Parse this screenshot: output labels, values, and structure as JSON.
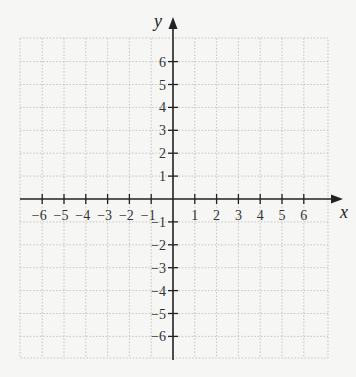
{
  "chart_data": {
    "type": "scatter",
    "title": "",
    "xlabel": "x",
    "ylabel": "y",
    "xlim": [
      -7,
      7
    ],
    "ylim": [
      -7,
      7
    ],
    "grid": true,
    "grid_style": "dotted",
    "x_ticks": [
      -6,
      -5,
      -4,
      -3,
      -2,
      -1,
      1,
      2,
      3,
      4,
      5,
      6
    ],
    "y_ticks": [
      6,
      5,
      4,
      3,
      2,
      1,
      -1,
      -2,
      -3,
      -4,
      -5,
      -6
    ],
    "x_tick_labels": [
      "−6",
      "−5",
      "−4",
      "−3",
      "−2",
      "−1",
      "1",
      "2",
      "3",
      "4",
      "5",
      "6"
    ],
    "y_tick_labels": [
      "6",
      "5",
      "4",
      "3",
      "2",
      "1",
      "−1",
      "−2",
      "−3",
      "−4",
      "−5",
      "−6"
    ],
    "series": [],
    "colors": {
      "background": "#f6f6f4",
      "grid": "#b8b8b8",
      "axis": "#222222",
      "text": "#333333"
    }
  },
  "labels": {
    "x_axis": "x",
    "y_axis": "y"
  }
}
